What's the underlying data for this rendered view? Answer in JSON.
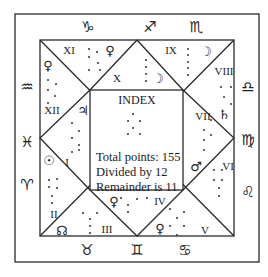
{
  "diagram": {
    "type": "ashtakavarga-style north-indian chart",
    "index": {
      "title": "INDEX",
      "lines": [
        "Total points: 155",
        "Divided by 12",
        "Remainder is 11"
      ]
    },
    "houses": [
      {
        "numeral": "I",
        "x": 67,
        "y": 162,
        "planet": "jupiter",
        "planet_glyph": "♃",
        "planet_x": 83,
        "planet_y": 110
      },
      {
        "numeral": "II",
        "x": 54,
        "y": 214,
        "planet": "sun",
        "planet_glyph": "☉",
        "planet_x": 49,
        "planet_y": 160
      },
      {
        "numeral": "III",
        "x": 107,
        "y": 229,
        "planet": "node",
        "planet_glyph": "☊",
        "planet_x": 62,
        "planet_y": 230
      },
      {
        "numeral": "IV",
        "x": 160,
        "y": 201,
        "planet": "venus",
        "planet_glyph": "♀",
        "planet_x": 114,
        "planet_y": 201
      },
      {
        "numeral": "V",
        "x": 205,
        "y": 230,
        "planet": "venus",
        "planet_glyph": "♀",
        "planet_x": 160,
        "planet_y": 228
      },
      {
        "numeral": "VI",
        "x": 228,
        "y": 166,
        "planet": "mars",
        "planet_glyph": "♂",
        "planet_x": 196,
        "planet_y": 166
      },
      {
        "numeral": "VII",
        "x": 203,
        "y": 116,
        "planet": "saturn",
        "planet_glyph": "♄",
        "planet_x": 224,
        "planet_y": 114
      },
      {
        "numeral": "VIII",
        "x": 224,
        "y": 71,
        "planet": "",
        "planet_glyph": "",
        "planet_x": 0,
        "planet_y": 0
      },
      {
        "numeral": "IX",
        "x": 171,
        "y": 50,
        "planet": "moon",
        "planet_glyph": "☽",
        "planet_x": 206,
        "planet_y": 51
      },
      {
        "numeral": "X",
        "x": 117,
        "y": 78,
        "planet": "moon",
        "planet_glyph": "☽",
        "planet_x": 158,
        "planet_y": 78
      },
      {
        "numeral": "XI",
        "x": 69,
        "y": 50,
        "planet": "venus",
        "planet_glyph": "♀",
        "planet_x": 110,
        "planet_y": 50
      },
      {
        "numeral": "XII",
        "x": 52,
        "y": 110,
        "planet": "venus",
        "planet_glyph": "♀",
        "planet_x": 48,
        "planet_y": 65
      }
    ],
    "signs": [
      {
        "name": "capricorn",
        "glyph": "♑",
        "x": 88,
        "y": 27
      },
      {
        "name": "sagittarius",
        "glyph": "♐",
        "x": 150,
        "y": 27
      },
      {
        "name": "scorpio",
        "glyph": "♏",
        "x": 196,
        "y": 27
      },
      {
        "name": "aquarius",
        "glyph": "♒",
        "x": 27,
        "y": 87
      },
      {
        "name": "pisces",
        "glyph": "♓",
        "x": 27,
        "y": 142
      },
      {
        "name": "aries",
        "glyph": "♈",
        "x": 27,
        "y": 185
      },
      {
        "name": "libra",
        "glyph": "♎",
        "x": 248,
        "y": 87
      },
      {
        "name": "virgo",
        "glyph": "♍",
        "x": 248,
        "y": 140
      },
      {
        "name": "leo",
        "glyph": "♌",
        "x": 248,
        "y": 192
      },
      {
        "name": "taurus",
        "glyph": "♉",
        "x": 87,
        "y": 250
      },
      {
        "name": "gemini",
        "glyph": "♊",
        "x": 137,
        "y": 250
      },
      {
        "name": "cancer",
        "glyph": "♋",
        "x": 185,
        "y": 250
      }
    ],
    "dots": [
      [
        89,
        49
      ],
      [
        97,
        52
      ],
      [
        89,
        57
      ],
      [
        98,
        63
      ],
      [
        89,
        70
      ],
      [
        100,
        70
      ],
      [
        48,
        80
      ],
      [
        56,
        84
      ],
      [
        48,
        90
      ],
      [
        55,
        96
      ],
      [
        48,
        103
      ],
      [
        72,
        123
      ],
      [
        79,
        131
      ],
      [
        72,
        138
      ],
      [
        79,
        145
      ],
      [
        72,
        152
      ],
      [
        79,
        150
      ],
      [
        49,
        180
      ],
      [
        49,
        187
      ],
      [
        57,
        179
      ],
      [
        57,
        188
      ],
      [
        52,
        196
      ],
      [
        52,
        203
      ],
      [
        83,
        213
      ],
      [
        90,
        219
      ],
      [
        97,
        213
      ],
      [
        90,
        226
      ],
      [
        90,
        233
      ],
      [
        133,
        114
      ],
      [
        128,
        121
      ],
      [
        140,
        121
      ],
      [
        133,
        128
      ],
      [
        128,
        134
      ],
      [
        140,
        134
      ],
      [
        121,
        198
      ],
      [
        128,
        205
      ],
      [
        137,
        199
      ],
      [
        147,
        198
      ],
      [
        128,
        212
      ],
      [
        170,
        209
      ],
      [
        184,
        212
      ],
      [
        177,
        218
      ],
      [
        170,
        226
      ],
      [
        184,
        226
      ],
      [
        177,
        235
      ],
      [
        214,
        170
      ],
      [
        222,
        170
      ],
      [
        214,
        180
      ],
      [
        222,
        180
      ],
      [
        219,
        188
      ],
      [
        219,
        196
      ],
      [
        204,
        130
      ],
      [
        204,
        140
      ],
      [
        204,
        150
      ],
      [
        211,
        120
      ],
      [
        211,
        135
      ],
      [
        221,
        87
      ],
      [
        231,
        87
      ],
      [
        224,
        97
      ],
      [
        231,
        104
      ],
      [
        188,
        49
      ],
      [
        188,
        55
      ],
      [
        188,
        62
      ],
      [
        188,
        68
      ],
      [
        188,
        75
      ],
      [
        146,
        60
      ],
      [
        146,
        67
      ],
      [
        146,
        74
      ],
      [
        146,
        81
      ]
    ]
  }
}
